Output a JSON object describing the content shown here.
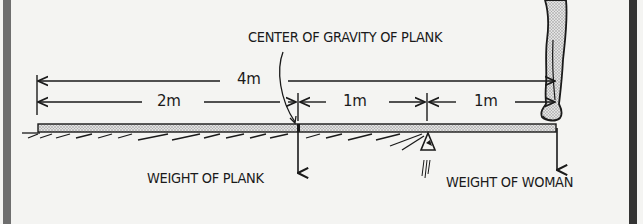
{
  "diagram": {
    "title_label": "CENTER OF GRAVITY OF PLANK",
    "dimensions": {
      "total": "4m",
      "left_segment": "2m",
      "middle_segment": "1m",
      "right_segment": "1m"
    },
    "force_labels": {
      "plank_weight": "WEIGHT OF PLANK",
      "woman_weight": "WEIGHT OF WOMAN"
    },
    "elements": [
      "plank",
      "fulcrum",
      "woman-legs",
      "ground-hatching"
    ],
    "colors": {
      "background": "#f4f4f2",
      "ink": "#1a1a1a",
      "frame": "#555555",
      "plank_fill": "#c8c8c8"
    }
  }
}
